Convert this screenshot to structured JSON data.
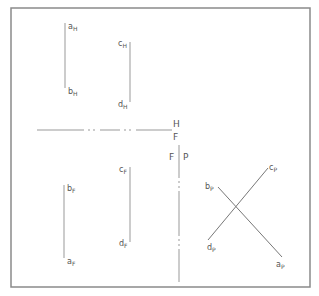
{
  "diagram": {
    "colors": {
      "line": "#999999",
      "frame": "#8a8a8a",
      "text": "#555555",
      "background": "#ffffff"
    },
    "reference_lines": {
      "hf": {
        "upper_label": "H",
        "lower_label": "F"
      },
      "fp": {
        "left_label": "F",
        "right_label": "P"
      }
    },
    "top_view": {
      "line_ab": {
        "start": {
          "main": "a",
          "sub": "H"
        },
        "end": {
          "main": "b",
          "sub": "H"
        }
      },
      "line_cd": {
        "start": {
          "main": "c",
          "sub": "H"
        },
        "end": {
          "main": "d",
          "sub": "H"
        }
      }
    },
    "front_view": {
      "line_ab": {
        "start": {
          "main": "b",
          "sub": "F"
        },
        "end": {
          "main": "a",
          "sub": "F"
        }
      },
      "line_cd": {
        "start": {
          "main": "c",
          "sub": "F"
        },
        "end": {
          "main": "d",
          "sub": "F"
        }
      }
    },
    "profile_view": {
      "line_ba": {
        "start": {
          "main": "b",
          "sub": "P"
        },
        "end": {
          "main": "a",
          "sub": "P"
        }
      },
      "line_dc": {
        "start": {
          "main": "d",
          "sub": "P"
        },
        "end": {
          "main": "c",
          "sub": "P"
        }
      }
    }
  }
}
